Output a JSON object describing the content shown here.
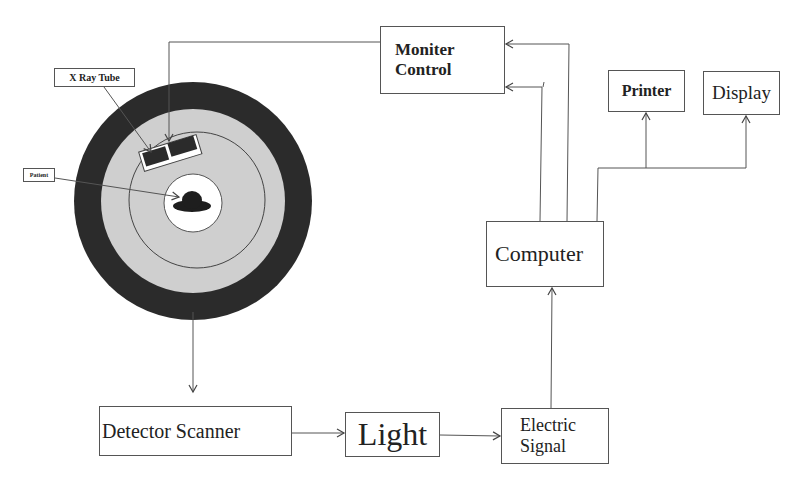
{
  "diagram": {
    "type": "block-flow",
    "boxes": {
      "xray_tube": "X Ray Tube",
      "patient": "Patient",
      "monitor_control": {
        "line1": "Moniter",
        "line2": "Control"
      },
      "printer": "Printer",
      "display": "Display",
      "computer": "Computer",
      "detector_scanner": "Detector Scanner",
      "light": "Light",
      "electric_signal": {
        "line1": "Electric",
        "line2": "Signal"
      }
    },
    "colors": {
      "outer_ring": "#2b2b2b",
      "gantry_fill": "#cfcfcf",
      "inner_bore": "#ffffff",
      "patient_shape": "#1e1e1e",
      "line": "#555555"
    },
    "connections": [
      {
        "from": "Monitor Control",
        "to": "X Ray Tube"
      },
      {
        "from": "Gantry",
        "to": "Detector Scanner"
      },
      {
        "from": "Detector Scanner",
        "to": "Light"
      },
      {
        "from": "Light",
        "to": "Electric Signal"
      },
      {
        "from": "Electric Signal",
        "to": "Computer"
      },
      {
        "from": "Computer",
        "to": "Monitor Control"
      },
      {
        "from": "Computer",
        "to": "Monitor Control"
      },
      {
        "from": "Computer",
        "to": "Printer"
      },
      {
        "from": "Computer",
        "to": "Display"
      }
    ]
  }
}
